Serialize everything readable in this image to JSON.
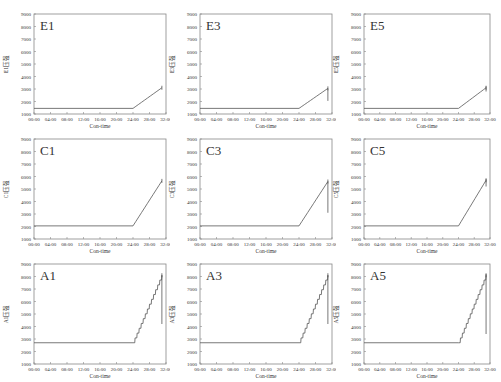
{
  "figure": {
    "layout": {
      "rows": 3,
      "cols": 3
    },
    "x_tick_labels": [
      "00:00",
      "04:00",
      "08:00",
      "12:00",
      "16:00",
      "20:00",
      "24:00",
      "28:00",
      "32:00"
    ],
    "y_tick_labels": [
      "1000",
      "2000",
      "3000",
      "4000",
      "5000",
      "6000",
      "7000",
      "8000",
      "9000"
    ],
    "xlabel": "Con-time",
    "line_color": "#555555",
    "frame_color": "#888888"
  },
  "chart_data": [
    {
      "type": "line",
      "title": "E1",
      "ylabel": "E1压强",
      "xlabel": "Con-time",
      "xlim": [
        0,
        32
      ],
      "ylim": [
        1000,
        9000
      ],
      "grid": false,
      "x": [
        0,
        24,
        31
      ],
      "values": [
        1450,
        1450,
        3100
      ],
      "drop": null,
      "row": 0,
      "col": 0
    },
    {
      "type": "line",
      "title": "E3",
      "ylabel": "E3压强",
      "xlabel": "Con-time",
      "xlim": [
        0,
        32
      ],
      "ylim": [
        1000,
        9000
      ],
      "grid": false,
      "x": [
        0,
        24,
        31
      ],
      "values": [
        1450,
        1450,
        3050
      ],
      "drop": [
        31,
        3050,
        2050
      ],
      "row": 0,
      "col": 1
    },
    {
      "type": "line",
      "title": "E5",
      "ylabel": "E5压强",
      "xlabel": "Con-time",
      "xlim": [
        0,
        32
      ],
      "ylim": [
        1000,
        9000
      ],
      "grid": false,
      "x": [
        0,
        24,
        31
      ],
      "values": [
        1450,
        1450,
        3100
      ],
      "drop": [
        31,
        3200,
        2800
      ],
      "row": 0,
      "col": 2
    },
    {
      "type": "line",
      "title": "C1",
      "ylabel": "C1压强",
      "xlabel": "Con-time",
      "xlim": [
        0,
        32
      ],
      "ylim": [
        1000,
        9000
      ],
      "grid": false,
      "x": [
        0,
        24,
        31
      ],
      "values": [
        2050,
        2050,
        5650
      ],
      "drop": null,
      "row": 1,
      "col": 0
    },
    {
      "type": "line",
      "title": "C3",
      "ylabel": "C3压强",
      "xlabel": "Con-time",
      "xlim": [
        0,
        32
      ],
      "ylim": [
        1000,
        9000
      ],
      "grid": false,
      "x": [
        0,
        24,
        31
      ],
      "values": [
        2050,
        2050,
        5600
      ],
      "drop": [
        31,
        5600,
        3100
      ],
      "row": 1,
      "col": 1
    },
    {
      "type": "line",
      "title": "C5",
      "ylabel": "C5压强",
      "xlabel": "Con-time",
      "xlim": [
        0,
        32
      ],
      "ylim": [
        1000,
        9000
      ],
      "grid": false,
      "x": [
        0,
        24,
        31
      ],
      "values": [
        2050,
        2050,
        5700
      ],
      "drop": [
        31,
        5800,
        5200
      ],
      "row": 1,
      "col": 2
    },
    {
      "type": "line",
      "title": "A1",
      "ylabel": "A1压强",
      "xlabel": "Con-time",
      "xlim": [
        0,
        32
      ],
      "ylim": [
        1000,
        9000
      ],
      "grid": false,
      "x": [
        0,
        24,
        31
      ],
      "values": [
        2700,
        2700,
        8100
      ],
      "drop": [
        31,
        8100,
        4200
      ],
      "stepped": true,
      "row": 2,
      "col": 0
    },
    {
      "type": "line",
      "title": "A3",
      "ylabel": "A3压强",
      "xlabel": "Con-time",
      "xlim": [
        0,
        32
      ],
      "ylim": [
        1000,
        9000
      ],
      "grid": false,
      "x": [
        0,
        24,
        31
      ],
      "values": [
        2700,
        2700,
        8100
      ],
      "drop": [
        31,
        8100,
        4200
      ],
      "stepped": true,
      "row": 2,
      "col": 1
    },
    {
      "type": "line",
      "title": "A5",
      "ylabel": "A5压强",
      "xlabel": "Con-time",
      "xlim": [
        0,
        32
      ],
      "ylim": [
        1000,
        9000
      ],
      "grid": false,
      "x": [
        0,
        24,
        31
      ],
      "values": [
        2700,
        2700,
        8100
      ],
      "drop": [
        31,
        8200,
        3400
      ],
      "stepped": true,
      "row": 2,
      "col": 2
    }
  ]
}
